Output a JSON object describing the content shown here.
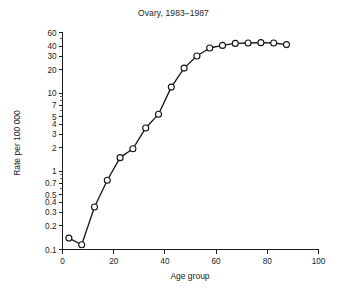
{
  "chart_data": {
    "type": "line",
    "title": "Ovary, 1983–1987",
    "xlabel": "Age group",
    "ylabel": "Rate per 100 000",
    "yscale": "log",
    "xlim": [
      0,
      100
    ],
    "ylim": [
      0.1,
      60
    ],
    "grid": false,
    "legend": null,
    "marker": "open-circle",
    "x": [
      2.5,
      7.5,
      12.5,
      17.5,
      22.5,
      27.5,
      32.5,
      37.5,
      42.5,
      47.5,
      52.5,
      57.5,
      62.5,
      67.5,
      72.5,
      77.5,
      82.5,
      87.5
    ],
    "y": [
      0.14,
      0.115,
      0.35,
      0.77,
      1.5,
      1.95,
      3.6,
      5.4,
      12.0,
      21.0,
      30.0,
      38.0,
      41.0,
      43.5,
      44.0,
      44.5,
      44.0,
      42.0
    ],
    "series": [
      {
        "name": "Ovary, 1983–1987",
        "values": [
          0.14,
          0.115,
          0.35,
          0.77,
          1.5,
          1.95,
          3.6,
          5.4,
          12.0,
          21.0,
          30.0,
          38.0,
          41.0,
          43.5,
          44.0,
          44.5,
          44.0,
          42.0
        ]
      }
    ],
    "yticks": [
      {
        "value": 60,
        "label": "60"
      },
      {
        "value": 40,
        "label": "40"
      },
      {
        "value": 30,
        "label": "30"
      },
      {
        "value": 20,
        "label": "20"
      },
      {
        "value": 10,
        "label": "10"
      },
      {
        "value": 7,
        "label": "7"
      },
      {
        "value": 5,
        "label": "5"
      },
      {
        "value": 4,
        "label": "4"
      },
      {
        "value": 3,
        "label": "3"
      },
      {
        "value": 2,
        "label": "2"
      },
      {
        "value": 1,
        "label": "1"
      },
      {
        "value": 0.7,
        "label": "0.7"
      },
      {
        "value": 0.5,
        "label": "0.5"
      },
      {
        "value": 0.4,
        "label": "0.4"
      },
      {
        "value": 0.3,
        "label": "0.3"
      },
      {
        "value": 0.2,
        "label": "0.2"
      },
      {
        "value": 0.1,
        "label": "0.1"
      }
    ],
    "yticks_minor": [
      50,
      9,
      8,
      6,
      0.9,
      0.8,
      0.6
    ],
    "xticks": [
      {
        "value": 0,
        "label": "0"
      },
      {
        "value": 20,
        "label": "20"
      },
      {
        "value": 40,
        "label": "40"
      },
      {
        "value": 60,
        "label": "60"
      },
      {
        "value": 80,
        "label": "80"
      },
      {
        "value": 100,
        "label": "100"
      }
    ],
    "colors": {
      "line": "#141414",
      "marker_fill": "#ffffff",
      "marker_stroke": "#141414",
      "axis": "#1c1c1c",
      "background": "#ffffff"
    }
  }
}
